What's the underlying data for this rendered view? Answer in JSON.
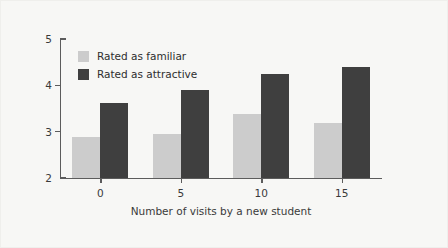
{
  "chart_data": {
    "type": "bar",
    "title": "",
    "subtitle": "",
    "xlabel": "Number of visits by a new student",
    "ylabel": "",
    "categories": [
      "0",
      "5",
      "10",
      "15"
    ],
    "series": [
      {
        "name": "Rated as familiar",
        "color": "#cccccc",
        "values": [
          2.88,
          2.95,
          3.38,
          3.18
        ]
      },
      {
        "name": "Rated as attractive",
        "color": "#3f3f3f",
        "values": [
          3.62,
          3.9,
          4.25,
          4.4
        ]
      }
    ],
    "ylim": [
      2,
      5
    ],
    "yticks": [
      "2",
      "3",
      "4",
      "5"
    ],
    "xticks": [
      "0",
      "5",
      "10",
      "15"
    ],
    "grid": false,
    "legend_position": "top-left"
  },
  "legend": {
    "items": [
      {
        "label": "Rated as familiar",
        "color": "#cccccc"
      },
      {
        "label": "Rated as attractive",
        "color": "#3f3f3f"
      }
    ]
  },
  "axes": {
    "y_tick_labels": [
      "5",
      "4",
      "3",
      "2"
    ],
    "x_tick_labels": [
      "0",
      "5",
      "10",
      "15"
    ],
    "x_axis_title": "Number of visits by a new student"
  },
  "colors": {
    "background": "#f7f7f5",
    "axis": "#5c5c5c",
    "text": "#3a3a3a",
    "series_familiar": "#cccccc",
    "series_attractive": "#3f3f3f"
  }
}
